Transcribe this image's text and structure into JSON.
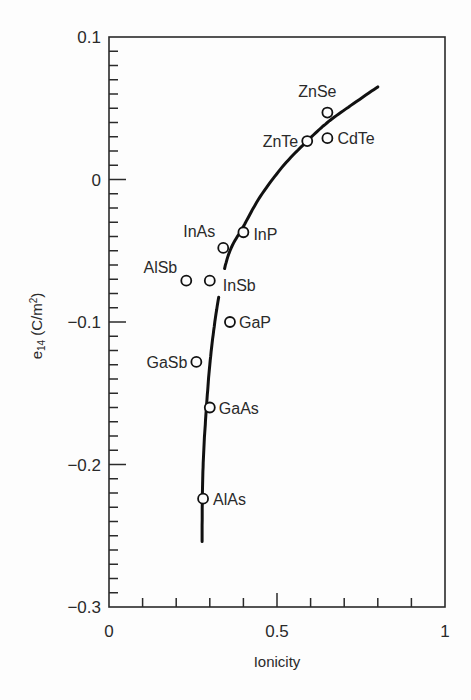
{
  "chart_data": {
    "type": "scatter",
    "title": "",
    "xlabel": "Ionicity",
    "ylabel": "e14 (C/m2)",
    "ylabel_parts": {
      "base": "e",
      "sub": "14",
      "unit_open": " (C/m",
      "sup": "2",
      "unit_close": ")"
    },
    "xlim": [
      0,
      1
    ],
    "ylim": [
      -0.3,
      0.1
    ],
    "grid": false,
    "legend": "none",
    "x_ticks": [
      {
        "value": 0,
        "label": "0"
      },
      {
        "value": 0.5,
        "label": "0.5"
      },
      {
        "value": 1,
        "label": "1"
      }
    ],
    "x_minor_step": 0.1,
    "y_ticks": [
      {
        "value": 0.1,
        "label": "0.1"
      },
      {
        "value": 0,
        "label": "0"
      },
      {
        "value": -0.1,
        "label": "−0.1"
      },
      {
        "value": -0.2,
        "label": "−0.2"
      },
      {
        "value": -0.3,
        "label": "−0.3"
      }
    ],
    "y_minor_step": 0.01,
    "points": [
      {
        "name": "ZnSe",
        "x": 0.65,
        "y": 0.047,
        "label_dx": -10,
        "label_dy": -16,
        "anchor": "middle"
      },
      {
        "name": "ZnTe",
        "x": 0.59,
        "y": 0.027,
        "label_dx": -9,
        "label_dy": 6,
        "anchor": "end"
      },
      {
        "name": "CdTe",
        "x": 0.65,
        "y": 0.029,
        "label_dx": 10,
        "label_dy": 6,
        "anchor": "start"
      },
      {
        "name": "InP",
        "x": 0.4,
        "y": -0.037,
        "label_dx": 10,
        "label_dy": 8,
        "anchor": "start"
      },
      {
        "name": "InAs",
        "x": 0.34,
        "y": -0.048,
        "label_dx": -8,
        "label_dy": -11,
        "anchor": "end"
      },
      {
        "name": "AlSb",
        "x": 0.23,
        "y": -0.071,
        "label_dx": -9,
        "label_dy": -8,
        "anchor": "end"
      },
      {
        "name": "InSb",
        "x": 0.3,
        "y": -0.071,
        "label_dx": 13,
        "label_dy": 10,
        "anchor": "start"
      },
      {
        "name": "GaP",
        "x": 0.36,
        "y": -0.1,
        "label_dx": 9,
        "label_dy": 6,
        "anchor": "start"
      },
      {
        "name": "GaSb",
        "x": 0.26,
        "y": -0.128,
        "label_dx": -9,
        "label_dy": 6,
        "anchor": "end"
      },
      {
        "name": "GaAs",
        "x": 0.3,
        "y": -0.16,
        "label_dx": 9,
        "label_dy": 6,
        "anchor": "start"
      },
      {
        "name": "AlAs",
        "x": 0.28,
        "y": -0.224,
        "label_dx": 10,
        "label_dy": 6,
        "anchor": "start"
      }
    ],
    "fit_curve": {
      "name": "trend",
      "x": [
        0.277,
        0.278,
        0.282,
        0.29,
        0.3,
        0.315,
        0.335,
        0.36,
        0.4,
        0.45,
        0.52,
        0.59,
        0.65,
        0.72,
        0.8
      ],
      "y": [
        -0.254,
        -0.22,
        -0.19,
        -0.16,
        -0.13,
        -0.1,
        -0.072,
        -0.05,
        -0.033,
        -0.012,
        0.01,
        0.027,
        0.04,
        0.052,
        0.065
      ],
      "gaps": [
        {
          "from_y": -0.082,
          "to_y": -0.064
        }
      ]
    },
    "colors": {
      "ink": "#2a2a2a",
      "background": "#fdfdfd"
    }
  }
}
